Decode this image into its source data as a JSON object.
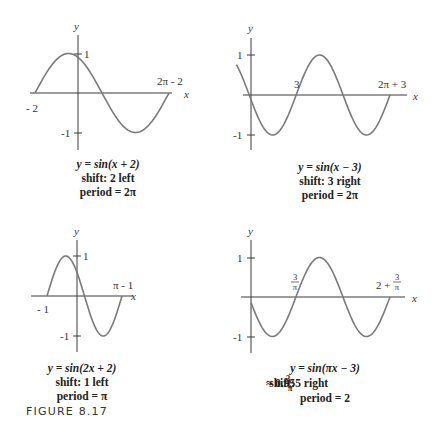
{
  "figure_label": "FIGURE 8.17",
  "panels": [
    {
      "id": "p1",
      "equation": "y = sin(x + 2)",
      "shift": "shift: 2 left",
      "period": "period = 2π",
      "labels": {
        "y_axis": "y",
        "x_axis": "x",
        "y_pos": "1",
        "y_neg": "-1",
        "x_left": "- 2",
        "x_right": "2π - 2"
      }
    },
    {
      "id": "p2",
      "equation": "y = sin(x − 3)",
      "shift": "shift: 3 right",
      "period": "period = 2π",
      "labels": {
        "y_axis": "y",
        "x_axis": "x",
        "y_pos": "1",
        "y_neg": "-1",
        "x_mid": "3",
        "x_right": "2π + 3"
      }
    },
    {
      "id": "p3",
      "equation": "y = sin(2x + 2)",
      "shift": "shift: 1 left",
      "period": "period = π",
      "labels": {
        "y_axis": "y",
        "x_axis": "x",
        "y_pos": "1",
        "y_neg": "-1",
        "x_left": "- 1",
        "x_right": "π - 1"
      }
    },
    {
      "id": "p4",
      "equation": "y = sin(πx − 3)",
      "shift_prefix": "shift:",
      "shift_frac_num": "3",
      "shift_frac_den": "π",
      "shift_suffix": "≈ 0.955 right",
      "period": "period = 2",
      "labels": {
        "y_axis": "y",
        "x_axis": "x",
        "y_pos": "1",
        "y_neg": "-1",
        "x_mid_num": "3",
        "x_mid_den": "π",
        "x_right_prefix": "2 +",
        "x_right_num": "3",
        "x_right_den": "π"
      }
    }
  ],
  "chart_data": [
    {
      "type": "line",
      "title": "y = sin(x + 2)",
      "xlabel": "x",
      "ylabel": "y",
      "function": "sin(x + 2)",
      "x_range": [
        -2,
        4.283
      ],
      "ylim": [
        -1,
        1
      ],
      "x_ticks": [
        "-2",
        "2π-2"
      ],
      "y_ticks": [
        "1",
        "-1"
      ],
      "annotations": [
        "shift: 2 left",
        "period = 2π"
      ],
      "grid": false
    },
    {
      "type": "line",
      "title": "y = sin(x - 3)",
      "xlabel": "x",
      "ylabel": "y",
      "function": "sin(x - 3)",
      "x_range": [
        -1,
        9.283
      ],
      "ylim": [
        -1,
        1
      ],
      "x_ticks": [
        "3",
        "2π+3"
      ],
      "y_ticks": [
        "1",
        "-1"
      ],
      "annotations": [
        "shift: 3 right",
        "period = 2π"
      ],
      "grid": false
    },
    {
      "type": "line",
      "title": "y = sin(2x + 2)",
      "xlabel": "x",
      "ylabel": "y",
      "function": "sin(2x + 2)",
      "x_range": [
        -1,
        2.1416
      ],
      "ylim": [
        -1,
        1
      ],
      "x_ticks": [
        "-1",
        "π-1"
      ],
      "y_ticks": [
        "1",
        "-1"
      ],
      "annotations": [
        "shift: 1 left",
        "period = π"
      ],
      "grid": false
    },
    {
      "type": "line",
      "title": "y = sin(πx - 3)",
      "xlabel": "x",
      "ylabel": "y",
      "function": "sin(πx - 3)",
      "x_range": [
        0,
        2.955
      ],
      "ylim": [
        -1,
        1
      ],
      "x_ticks": [
        "3/π",
        "2+3/π"
      ],
      "y_ticks": [
        "1",
        "-1"
      ],
      "annotations": [
        "shift: 3/π ≈ 0.955 right",
        "period = 2"
      ],
      "grid": false
    }
  ]
}
